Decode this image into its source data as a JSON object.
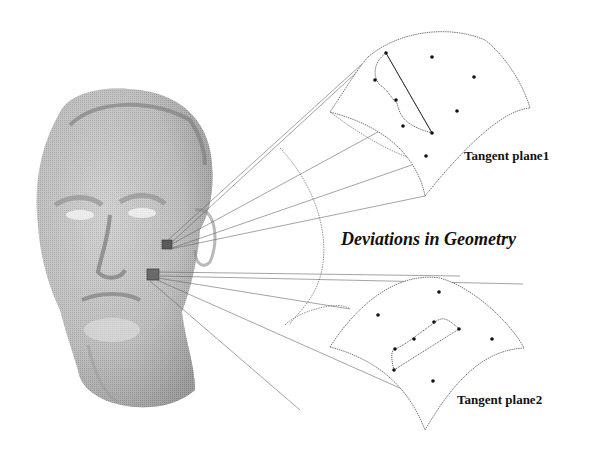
{
  "figure": {
    "labels": {
      "tangent_plane_1": "Tangent plane1",
      "tangent_plane_2": "Tangent plane2",
      "deviation": "Deviations in Geometry"
    },
    "colors": {
      "line": "#555555",
      "dot": "#111111",
      "patch": "#555555",
      "head_light": "#e6e6e6",
      "head_dark": "#6e6e6e"
    }
  }
}
